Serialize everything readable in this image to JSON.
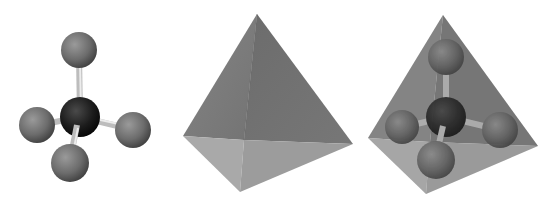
{
  "figure": {
    "panels": [
      {
        "id": "ball-and-stick",
        "central_atom_color": "#1a1a1a",
        "outer_atom_color": "#6e6e6e",
        "bond_color": "#c8c8c8"
      },
      {
        "id": "tetrahedron",
        "face_dark": "#757575",
        "face_mid": "#8a8a8a",
        "face_light": "#a9a9a9"
      },
      {
        "id": "model-in-tetrahedron"
      }
    ],
    "colors": {
      "background": "#ffffff",
      "central_atom": "#1a1a1a",
      "outer_atom": "#6e6e6e",
      "bond": "#c8c8c8",
      "tet_front_left": "#7c7c7c",
      "tet_front_right": "#6f6f6f",
      "tet_bottom_left": "#a8a8a8",
      "tet_bottom_right": "#9a9a9a"
    }
  }
}
